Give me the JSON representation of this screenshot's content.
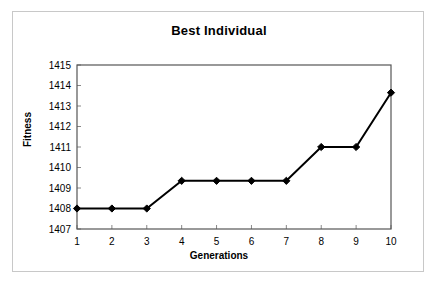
{
  "chart_data": {
    "type": "line",
    "title": "Best Individual",
    "xlabel": "Generations",
    "ylabel": "Fitness",
    "x": [
      1,
      2,
      3,
      4,
      5,
      6,
      7,
      8,
      9,
      10
    ],
    "categories": [
      "1",
      "2",
      "3",
      "4",
      "5",
      "6",
      "7",
      "8",
      "9",
      "10"
    ],
    "values": [
      1408,
      1408,
      1408,
      1409.35,
      1409.35,
      1409.35,
      1409.35,
      1411,
      1411,
      1413.65
    ],
    "series": [
      {
        "name": "Best Individual",
        "values": [
          1408,
          1408,
          1408,
          1409.35,
          1409.35,
          1409.35,
          1409.35,
          1411,
          1411,
          1413.65
        ]
      }
    ],
    "xlim": [
      1,
      10
    ],
    "ylim": [
      1407,
      1415
    ],
    "ytick_labels": [
      "1407",
      "1408",
      "1409",
      "1410",
      "1411",
      "1412",
      "1413",
      "1414",
      "1415"
    ],
    "yticks": [
      1407,
      1408,
      1409,
      1410,
      1411,
      1412,
      1413,
      1414,
      1415
    ],
    "xtick_labels": [
      "1",
      "2",
      "3",
      "4",
      "5",
      "6",
      "7",
      "8",
      "9",
      "10"
    ],
    "xticks": [
      1,
      2,
      3,
      4,
      5,
      6,
      7,
      8,
      9,
      10
    ],
    "grid": false,
    "legend": false,
    "legend_position": "none",
    "marker": "diamond",
    "line_color": "#000000",
    "marker_color": "#000000",
    "plot_background": "#ffffff",
    "frame_border_color": "#c8c8c8",
    "axis_color": "#555555"
  }
}
